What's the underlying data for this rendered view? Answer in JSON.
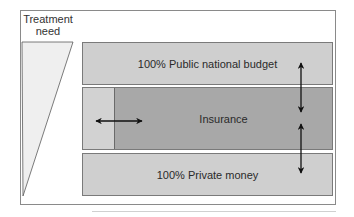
{
  "diagram": {
    "treatment_need_label": "Treatment\nneed",
    "treatment_need_line1": "Treatment",
    "treatment_need_line2": "need",
    "boxes": [
      {
        "id": "public",
        "label": "100% Public national budget",
        "color": "#cfcfcf"
      },
      {
        "id": "insurance",
        "label": "Insurance",
        "color": "#a8a8a8",
        "left_strip_color": "#d2d2d2"
      },
      {
        "id": "private",
        "label": "100% Private money",
        "color": "#cfcfcf"
      }
    ],
    "arrows": [
      {
        "type": "vertical-double",
        "between": [
          "public",
          "insurance"
        ]
      },
      {
        "type": "vertical-double",
        "between": [
          "insurance",
          "private"
        ]
      },
      {
        "type": "horizontal-double",
        "within": "insurance-left-boundary"
      }
    ]
  }
}
